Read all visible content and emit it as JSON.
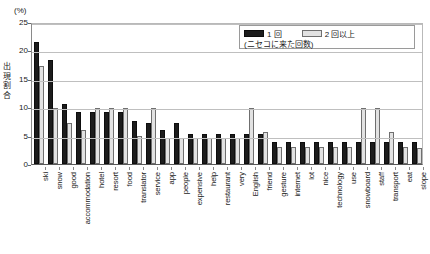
{
  "chart_data": {
    "type": "bar",
    "title": "",
    "subtitle": "",
    "xlabel": "",
    "ylabel": "出現割合",
    "yunit": "(%)",
    "ylim": [
      0,
      25
    ],
    "yticks": [
      0,
      5,
      10,
      15,
      20,
      25
    ],
    "grid": true,
    "legend_position": "top-right",
    "legend_note": "(ニセコに来た回数)",
    "categories": [
      "ski",
      "snow",
      "good",
      "accommodation",
      "hotel",
      "resort",
      "food",
      "translator",
      "service",
      "app",
      "people",
      "expensive",
      "help",
      "restaurant",
      "very",
      "English",
      "friend",
      "gesture",
      "internet",
      "lot",
      "nice",
      "technology",
      "use",
      "snowboard",
      "staff",
      "transport",
      "eat",
      "slope"
    ],
    "series": [
      {
        "name": "1 回",
        "color": "#1c1c1c",
        "values": [
          21.4,
          18.3,
          10.5,
          9.2,
          9.2,
          9.2,
          9.2,
          7.6,
          7.2,
          6.0,
          7.2,
          5.2,
          5.2,
          5.2,
          5.2,
          5.2,
          5.2,
          3.9,
          3.9,
          3.9,
          3.9,
          3.9,
          3.9,
          3.9,
          3.9,
          3.9,
          3.9,
          3.9
        ]
      },
      {
        "name": "2 回以上",
        "color": "#e2e2e2",
        "values": [
          17.2,
          9.8,
          7.3,
          6.0,
          9.8,
          9.8,
          9.8,
          5.0,
          9.8,
          4.5,
          4.5,
          4.5,
          4.5,
          4.5,
          4.5,
          9.8,
          5.6,
          3.0,
          3.0,
          3.0,
          3.0,
          3.0,
          3.0,
          9.8,
          9.8,
          5.6,
          3.0,
          2.8
        ]
      }
    ]
  },
  "legend": {
    "series1_label": "1 回",
    "series2_label": "2 回以上",
    "note": "(ニセコに来た回数)"
  },
  "axis": {
    "y_unit": "(%)",
    "y_title_chars": [
      "出",
      "現",
      "割",
      "合"
    ],
    "y_tick_labels": [
      "25",
      "20",
      "15",
      "10",
      "5",
      "0"
    ]
  }
}
